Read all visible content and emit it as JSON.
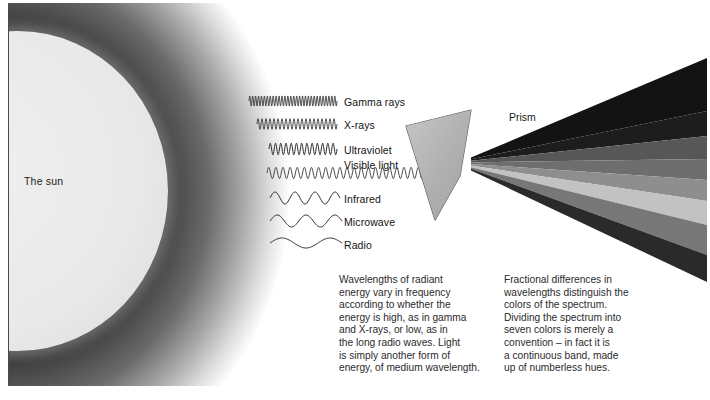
{
  "diagram": {
    "sun_label": "The sun",
    "prism_label": "Prism"
  },
  "spectrum_bands": [
    {
      "name": "band-1",
      "color": "#131313"
    },
    {
      "name": "band-2",
      "color": "#1d1d1d"
    },
    {
      "name": "band-3",
      "color": "#575757"
    },
    {
      "name": "band-4",
      "color": "#6e6e6e"
    },
    {
      "name": "band-5",
      "color": "#8e8e8e"
    },
    {
      "name": "band-6",
      "color": "#c2c2c2"
    },
    {
      "name": "band-7",
      "color": "#777777"
    },
    {
      "name": "band-8",
      "color": "#2a2a2a"
    }
  ],
  "waves": [
    {
      "label": "Gamma rays",
      "cycles": 30,
      "amp": 5.0,
      "x": 241,
      "len": 88,
      "y": 98,
      "lx": 336,
      "ly": 93
    },
    {
      "label": "X-rays",
      "cycles": 20,
      "amp": 5.4,
      "x": 249,
      "len": 80,
      "y": 121,
      "lx": 336,
      "ly": 116
    },
    {
      "label": "Ultraviolet",
      "cycles": 13,
      "amp": 5.8,
      "x": 261,
      "len": 68,
      "y": 146,
      "lx": 336,
      "ly": 141
    },
    {
      "label": "Visible light",
      "cycles": 26,
      "amp": 5.6,
      "x": 259,
      "len": 185,
      "y": 170,
      "lx": 336,
      "ly": 156
    },
    {
      "label": "Infrared",
      "cycles": 3.5,
      "amp": 6.0,
      "x": 262,
      "len": 70,
      "y": 195,
      "lx": 336,
      "ly": 190
    },
    {
      "label": "Microwave",
      "cycles": 2.5,
      "amp": 6.0,
      "x": 262,
      "len": 72,
      "y": 218,
      "lx": 336,
      "ly": 213
    },
    {
      "label": "Radio",
      "cycles": 1.5,
      "amp": 5.0,
      "x": 262,
      "len": 72,
      "y": 240,
      "lx": 336,
      "ly": 236
    }
  ],
  "captions": {
    "left": "Wavelengths of radiant\nenergy vary in frequency\naccording to whether the\nenergy is high, as in gamma\nand X-rays, or low, as in\nthe long radio waves. Light\nis simply another form of\nenergy, of medium wavelength.",
    "right": "Fractional differences in\nwavelengths distinguish the\ncolors of the spectrum.\nDividing the spectrum into\nseven colors is merely a\nconvention – in fact it is\na continuous band, made\nup of numberless hues."
  },
  "colors": {
    "prism_fill": "#b4b4b4",
    "prism_stroke": "#5d5d5d",
    "wave_stroke": "#2e2e2e",
    "text": "#2b2b2b",
    "frame": "#4a4a4a"
  }
}
